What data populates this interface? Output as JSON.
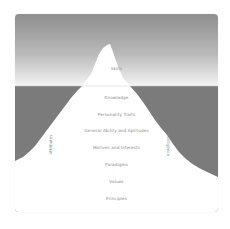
{
  "diagram": {
    "type": "iceberg",
    "above_water": {
      "label": "Skills"
    },
    "below_water": {
      "layers": [
        {
          "label": "Knowledge"
        },
        {
          "label": "Personality Traits"
        },
        {
          "label": "General Ability and Aptitudes"
        },
        {
          "label": "Motives and Interests"
        },
        {
          "label": "Paradigms"
        },
        {
          "label": "Values"
        },
        {
          "label": "Principles"
        }
      ]
    },
    "side_labels": {
      "left": "Attributes",
      "right": "Intelligence"
    },
    "colors": {
      "sky_top": "#8e8e8e",
      "sky_bottom": "#f2f2f2",
      "water": "#7b7b7b",
      "iceberg": "#ffffff",
      "text": "#8a8a8a"
    }
  }
}
